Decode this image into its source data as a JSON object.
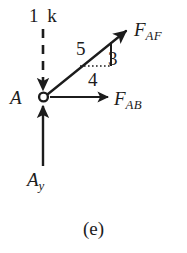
{
  "figure": {
    "caption": "(e)",
    "kind": "free-body-diagram",
    "joint_label": "A",
    "background_color": "#ffffff",
    "ink_color": "#1c1c1c"
  },
  "labels": {
    "applied_load": "1 k",
    "force_af": {
      "symbol": "F",
      "subscript": "AF"
    },
    "force_ab": {
      "symbol": "F",
      "subscript": "AB"
    },
    "reaction_ay": {
      "symbol": "A",
      "subscript": "y"
    },
    "joint": "A"
  },
  "slope_triangle": {
    "hypotenuse": "5",
    "vertical": "3",
    "horizontal": "4"
  },
  "vectors": [
    {
      "name": "applied-load-1k",
      "label": "1 k",
      "direction": "down",
      "style": "dashed",
      "from": [
        43,
        30
      ],
      "to": [
        43,
        92
      ]
    },
    {
      "name": "force-af",
      "label": "F_AF",
      "direction": "up-right",
      "style": "solid",
      "from": [
        47,
        95
      ],
      "to": [
        128,
        30
      ]
    },
    {
      "name": "force-ab",
      "label": "F_AB",
      "direction": "right",
      "style": "solid",
      "from": [
        49,
        97
      ],
      "to": [
        110,
        97
      ]
    },
    {
      "name": "reaction-ay",
      "label": "A_y",
      "direction": "up",
      "style": "solid",
      "from": [
        43,
        166
      ],
      "to": [
        43,
        103
      ]
    }
  ]
}
